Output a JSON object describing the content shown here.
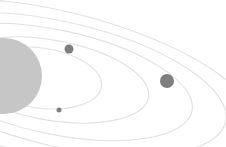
{
  "illustration": {
    "subject": "solar-system",
    "colors": {
      "background": "#ffffff",
      "orbit": "#e2e2e2",
      "sun": "#c6c6c6",
      "planet_small": "#808080",
      "planet_medium": "#7d7d7d",
      "planet_large": "#7f7f7f"
    },
    "bodies": [
      {
        "name": "sun",
        "kind": "star"
      },
      {
        "name": "planet-inner",
        "kind": "planet",
        "size": "small"
      },
      {
        "name": "planet-middle",
        "kind": "planet",
        "size": "medium"
      },
      {
        "name": "planet-outer",
        "kind": "planet",
        "size": "large"
      }
    ]
  }
}
